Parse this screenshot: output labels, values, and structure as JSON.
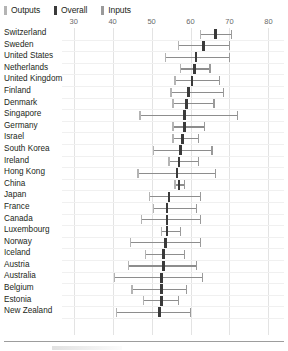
{
  "legend": {
    "items": [
      {
        "label": "Outputs",
        "color": "#b4b4b4",
        "icon": "square-swatch-icon"
      },
      {
        "label": "Overall",
        "color": "#3a3a3a",
        "icon": "square-swatch-icon"
      },
      {
        "label": "Inputs",
        "color": "#9a9a9a",
        "icon": "square-swatch-icon"
      }
    ]
  },
  "chart_data": {
    "type": "bar",
    "title": "",
    "subtitle": "",
    "xlabel": "",
    "ylabel": "",
    "xlim": [
      27,
      84
    ],
    "xticks": [
      30,
      40,
      50,
      60,
      70,
      80
    ],
    "xtick_labels": [
      "30",
      "40",
      "50",
      "60",
      "70",
      "80"
    ],
    "grid": true,
    "legend_position": "top-left",
    "series": [
      {
        "name": "Outputs",
        "color": "#b4b4b4"
      },
      {
        "name": "Overall",
        "color": "#3a3a3a"
      },
      {
        "name": "Inputs",
        "color": "#9a9a9a"
      }
    ],
    "categories": [
      "Switzerland",
      "Sweden",
      "United States",
      "Netherlands",
      "United Kingdom",
      "Finland",
      "Denmark",
      "Singapore",
      "Germany",
      "Israel",
      "South Korea",
      "Ireland",
      "Hong Kong",
      "China",
      "Japan",
      "France",
      "Canada",
      "Luxembourg",
      "Norway",
      "Iceland",
      "Austria",
      "Australia",
      "Belgium",
      "Estonia",
      "New Zealand"
    ],
    "rows": [
      {
        "category": "Switzerland",
        "outputs": 62.5,
        "overall": 66.4,
        "inputs": 70.5
      },
      {
        "category": "Sweden",
        "outputs": 57.0,
        "overall": 63.4,
        "inputs": 70.0
      },
      {
        "category": "United States",
        "outputs": 53.5,
        "overall": 61.4,
        "inputs": 70.0
      },
      {
        "category": "Netherlands",
        "outputs": 57.5,
        "overall": 61.0,
        "inputs": 65.0
      },
      {
        "category": "United Kingdom",
        "outputs": 56.0,
        "overall": 60.4,
        "inputs": 67.5
      },
      {
        "category": "Finland",
        "outputs": 55.0,
        "overall": 59.5,
        "inputs": 68.5
      },
      {
        "category": "Denmark",
        "outputs": 55.5,
        "overall": 59.0,
        "inputs": 66.0
      },
      {
        "category": "Singapore",
        "outputs": 47.0,
        "overall": 58.5,
        "inputs": 72.0
      },
      {
        "category": "Germany",
        "outputs": 55.5,
        "overall": 58.5,
        "inputs": 63.5
      },
      {
        "category": "Israel",
        "outputs": 55.5,
        "overall": 58.0,
        "inputs": 62.0
      },
      {
        "category": "South Korea",
        "outputs": 50.5,
        "overall": 57.5,
        "inputs": 65.5
      },
      {
        "category": "Ireland",
        "outputs": 54.5,
        "overall": 57.0,
        "inputs": 62.0
      },
      {
        "category": "Hong Kong",
        "outputs": 46.5,
        "overall": 56.5,
        "inputs": 66.5
      },
      {
        "category": "China",
        "outputs": 56.0,
        "overall": 57.0,
        "inputs": 58.5
      },
      {
        "category": "Japan",
        "outputs": 49.5,
        "overall": 54.5,
        "inputs": 62.5
      },
      {
        "category": "France",
        "outputs": 50.5,
        "overall": 54.0,
        "inputs": 61.5
      },
      {
        "category": "Canada",
        "outputs": 47.5,
        "overall": 54.0,
        "inputs": 62.5
      },
      {
        "category": "Luxembourg",
        "outputs": 52.5,
        "overall": 54.0,
        "inputs": 57.5
      },
      {
        "category": "Norway",
        "outputs": 44.5,
        "overall": 53.5,
        "inputs": 62.5
      },
      {
        "category": "Iceland",
        "outputs": 48.5,
        "overall": 53.0,
        "inputs": 58.5
      },
      {
        "category": "Austria",
        "outputs": 44.0,
        "overall": 53.0,
        "inputs": 61.5
      },
      {
        "category": "Australia",
        "outputs": 40.5,
        "overall": 52.5,
        "inputs": 63.0
      },
      {
        "category": "Belgium",
        "outputs": 45.0,
        "overall": 52.5,
        "inputs": 59.0
      },
      {
        "category": "Estonia",
        "outputs": 48.0,
        "overall": 52.5,
        "inputs": 57.0
      },
      {
        "category": "New Zealand",
        "outputs": 41.0,
        "overall": 52.0,
        "inputs": 60.0
      }
    ]
  }
}
